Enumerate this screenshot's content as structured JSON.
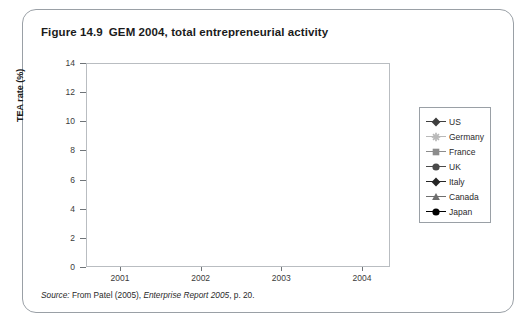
{
  "figure": {
    "number": "Figure 14.9",
    "title": "GEM 2004, total entrepreneurial activity"
  },
  "source": {
    "label": "Source:",
    "text_before": " From Patel (2005), ",
    "italic": "Enterprise Report 2005",
    "text_after": ", p. 20."
  },
  "colors": {
    "us": "#3f3f3f",
    "germany": "#b9b9b9",
    "france": "#8c8c8c",
    "uk": "#4a4a4a",
    "italy": "#262626",
    "canada": "#6e6e6e",
    "japan": "#000000",
    "axis": "#6f7478",
    "frame": "#b9bdc1",
    "border": "#9aa0a6"
  },
  "chart_data": {
    "type": "line",
    "title": "GEM 2004, total entrepreneurial activity",
    "xlabel": "",
    "ylabel": "TEA rate (%)",
    "categories": [
      "2001",
      "2002",
      "2003",
      "2004"
    ],
    "x_tick_labels": [
      "2001",
      "2002",
      "2003",
      "2004"
    ],
    "y_tick_labels": [
      "0",
      "2",
      "4",
      "6",
      "8",
      "10",
      "12",
      "14"
    ],
    "y_ticks": [
      0,
      2,
      4,
      6,
      8,
      10,
      12,
      14
    ],
    "ylim": [
      0,
      14
    ],
    "grid": false,
    "legend_position": "right",
    "series": [
      {
        "name": "US",
        "marker": "diamond",
        "color": "#3f3f3f",
        "values": [
          12.0,
          10.5,
          11.95,
          11.65
        ]
      },
      {
        "name": "Germany",
        "marker": "star",
        "color": "#b9b9b9",
        "values": [
          7.9,
          5.2,
          5.3,
          4.3
        ]
      },
      {
        "name": "France",
        "marker": "square",
        "color": "#8c8c8c",
        "values": [
          7.4,
          3.2,
          1.7,
          5.9
        ]
      },
      {
        "name": "UK",
        "marker": "circle",
        "color": "#4a4a4a",
        "values": [
          7.3,
          5.8,
          6.5,
          6.6
        ]
      },
      {
        "name": "Italy",
        "marker": "diamond",
        "color": "#262626",
        "values": [
          7.6,
          5.6,
          3.5,
          4.35
        ]
      },
      {
        "name": "Canada",
        "marker": "triangle",
        "color": "#6e6e6e",
        "values": [
          11.2,
          9.0,
          8.0,
          8.9
        ]
      },
      {
        "name": "Japan",
        "marker": "circle",
        "color": "#000000",
        "values": [
          5.3,
          1.8,
          2.4,
          1.5
        ]
      }
    ]
  }
}
